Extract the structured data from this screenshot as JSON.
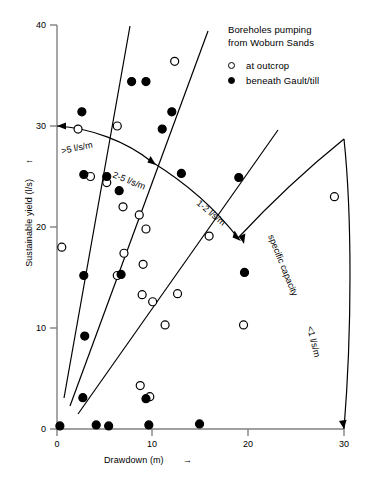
{
  "legend": {
    "title_line1": "Boreholes pumping",
    "title_line2": "from Woburn Sands",
    "entries": [
      {
        "marker": "open-circle-icon",
        "label": "at outcrop"
      },
      {
        "marker": "filled-circle-icon",
        "label": "beneath Gault/till"
      }
    ]
  },
  "chart_data": {
    "type": "scatter",
    "title": "",
    "xlabel": "Drawdown (m)",
    "ylabel": "Sustainable yield (l/s)",
    "xlabel_suffix": "→",
    "ylabel_suffix": "↑",
    "xlim": [
      0,
      30
    ],
    "ylim": [
      0,
      40
    ],
    "xticks": [
      0,
      10,
      20,
      30
    ],
    "yticks": [
      0,
      10,
      20,
      30,
      40
    ],
    "xtick_labels": [
      "0",
      "10",
      "20",
      "30"
    ],
    "ytick_labels": [
      "0",
      "10",
      "20",
      "30",
      "40"
    ],
    "grid": false,
    "legend_position": "top-right",
    "series": [
      {
        "name": "at outcrop",
        "marker": "open-circle",
        "points": [
          [
            0.5,
            18.0
          ],
          [
            2.2,
            29.7
          ],
          [
            3.5,
            25.0
          ],
          [
            5.2,
            24.4
          ],
          [
            6.3,
            30.0
          ],
          [
            6.9,
            22.0
          ],
          [
            8.6,
            21.2
          ],
          [
            9.3,
            19.8
          ],
          [
            7.0,
            17.4
          ],
          [
            6.3,
            15.2
          ],
          [
            9.0,
            16.3
          ],
          [
            8.9,
            13.3
          ],
          [
            10.0,
            12.6
          ],
          [
            12.3,
            36.4
          ],
          [
            12.6,
            13.4
          ],
          [
            8.7,
            4.3
          ],
          [
            9.7,
            3.2
          ],
          [
            11.3,
            10.3
          ],
          [
            15.9,
            19.1
          ],
          [
            19.5,
            10.3
          ],
          [
            29.0,
            23.0
          ]
        ]
      },
      {
        "name": "beneath Gault/till",
        "marker": "filled-circle",
        "points": [
          [
            0.3,
            0.3
          ],
          [
            2.6,
            31.4
          ],
          [
            2.8,
            25.2
          ],
          [
            2.8,
            15.2
          ],
          [
            2.9,
            9.2
          ],
          [
            2.7,
            3.1
          ],
          [
            4.1,
            0.4
          ],
          [
            5.4,
            0.3
          ],
          [
            5.2,
            25.0
          ],
          [
            6.5,
            23.6
          ],
          [
            6.7,
            15.3
          ],
          [
            7.8,
            34.4
          ],
          [
            9.3,
            34.4
          ],
          [
            9.6,
            0.4
          ],
          [
            9.3,
            3.0
          ],
          [
            11.0,
            29.7
          ],
          [
            12.0,
            31.4
          ],
          [
            14.9,
            0.5
          ],
          [
            13.0,
            25.3
          ],
          [
            19.0,
            24.9
          ],
          [
            19.6,
            15.5
          ]
        ]
      }
    ],
    "annotations": [
      {
        "name": "gt5-label",
        "text": ">5 l/s/m"
      },
      {
        "name": "2-5-label",
        "text": "2-5 l/s/m"
      },
      {
        "name": "1-2-label",
        "text": "1-2 l/s/m"
      },
      {
        "name": "lt1-label",
        "text": "<1 l/s/m"
      },
      {
        "name": "specific-capacity-label",
        "text": "specific capacity"
      }
    ]
  }
}
